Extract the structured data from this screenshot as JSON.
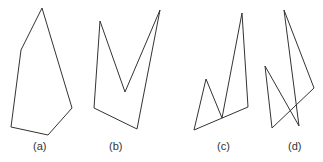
{
  "figure": {
    "polygons": [
      {
        "id": "a",
        "label": "(a)",
        "description": "convex polygon",
        "points": "42,8 21,50 11,127 48,135 72,108"
      },
      {
        "id": "b",
        "label": "(b)",
        "description": "concave polygon",
        "points": "100,21 125,92 160,10 137,129 94,108"
      },
      {
        "id": "c",
        "label": "(c)",
        "description": "concave polygon with touching vertex",
        "points": "194,130 206,79 222,118 242,13 248,107"
      },
      {
        "id": "d",
        "label": "(d)",
        "description": "self-intersecting polygon",
        "points": "284,10 314,88 272,128 265,66 299,126"
      }
    ],
    "stroke_color": "#333333"
  }
}
